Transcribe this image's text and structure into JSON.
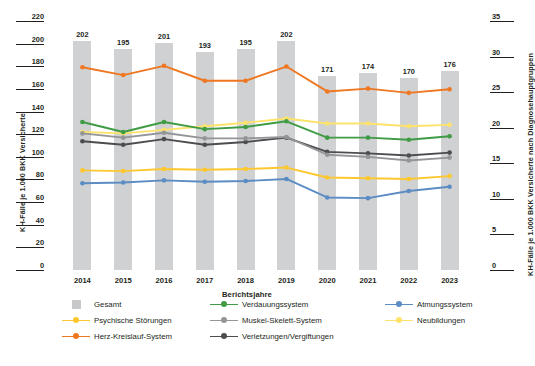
{
  "chart_data": {
    "type": "bar",
    "title": "",
    "subtitle": "",
    "xlabel": "Berichtsjahre",
    "ylabel": "KH-Fälle je 1.000 BKK Versicherte",
    "ylabel_right": "KH-Fälle je 1.000 BKK Versicherte nach Diagnosehauptgruppen",
    "categories": [
      "2014",
      "2015",
      "2016",
      "2017",
      "2018",
      "2019",
      "2020",
      "2021",
      "2022",
      "2023"
    ],
    "ylim": [
      0,
      220
    ],
    "yticks": [
      0,
      20,
      40,
      60,
      80,
      100,
      120,
      140,
      160,
      180,
      200,
      220
    ],
    "ylim_right": [
      0,
      35
    ],
    "yticks_right": [
      0,
      5,
      10,
      15,
      20,
      25,
      30,
      35
    ],
    "grid": false,
    "legend_position": "bottom",
    "bars": {
      "name": "Gesamt",
      "axis": "left",
      "color": "#c8c9ca",
      "values": [
        202,
        195,
        201,
        193,
        195,
        202,
        171,
        174,
        170,
        176
      ]
    },
    "series": [
      {
        "name": "Herz-Kreislauf-System",
        "axis": "right",
        "color": "#ef7722",
        "values": [
          28.5,
          27.4,
          28.7,
          26.6,
          26.6,
          28.6,
          25.1,
          25.5,
          24.9,
          25.4
        ]
      },
      {
        "name": "Neubildungen",
        "axis": "right",
        "color": "#fde36b",
        "values": [
          19.4,
          19.2,
          19.7,
          20.2,
          20.7,
          21.3,
          20.6,
          20.6,
          20.2,
          20.4
        ]
      },
      {
        "name": "Verdauungssystem",
        "axis": "right",
        "color": "#3f9c45",
        "values": [
          20.8,
          19.4,
          20.8,
          19.8,
          20.1,
          20.9,
          18.6,
          18.6,
          18.3,
          18.8
        ]
      },
      {
        "name": "Verletzungen/Vergiftungen",
        "axis": "right",
        "color": "#4d4d4f",
        "values": [
          18.1,
          17.6,
          18.4,
          17.6,
          18.0,
          18.6,
          16.6,
          16.4,
          16.1,
          16.5
        ]
      },
      {
        "name": "Muskel-Skelett-System",
        "axis": "right",
        "color": "#939598",
        "values": [
          19.2,
          18.6,
          19.3,
          18.5,
          18.5,
          18.7,
          16.2,
          15.9,
          15.4,
          15.8
        ]
      },
      {
        "name": "Psychische Störungen",
        "axis": "right",
        "color": "#fdc82f",
        "values": [
          14.0,
          13.9,
          14.2,
          14.1,
          14.2,
          14.4,
          13.0,
          12.9,
          12.8,
          13.2
        ]
      },
      {
        "name": "Atmungssystem",
        "axis": "right",
        "color": "#5b8cc4",
        "values": [
          12.2,
          12.3,
          12.6,
          12.4,
          12.5,
          12.8,
          10.2,
          10.1,
          11.1,
          11.7
        ]
      }
    ]
  },
  "legend": {
    "items": [
      {
        "label": "Gesamt",
        "marker": "box",
        "color": "#c8c9ca"
      },
      {
        "label": "Verdauungssystem",
        "marker": "line",
        "color": "#3f9c45"
      },
      {
        "label": "Atmungssystem",
        "marker": "line",
        "color": "#5b8cc4"
      },
      {
        "label": "Psychische Störungen",
        "marker": "line",
        "color": "#fdc82f"
      },
      {
        "label": "Muskel-Skelett-System",
        "marker": "line",
        "color": "#939598"
      },
      {
        "label": "Neubildungen",
        "marker": "line",
        "color": "#fde36b"
      },
      {
        "label": "Herz-Kreislauf-System",
        "marker": "line",
        "color": "#ef7722"
      },
      {
        "label": "Verletzungen/Vergiftungen",
        "marker": "line",
        "color": "#4d4d4f"
      }
    ]
  }
}
